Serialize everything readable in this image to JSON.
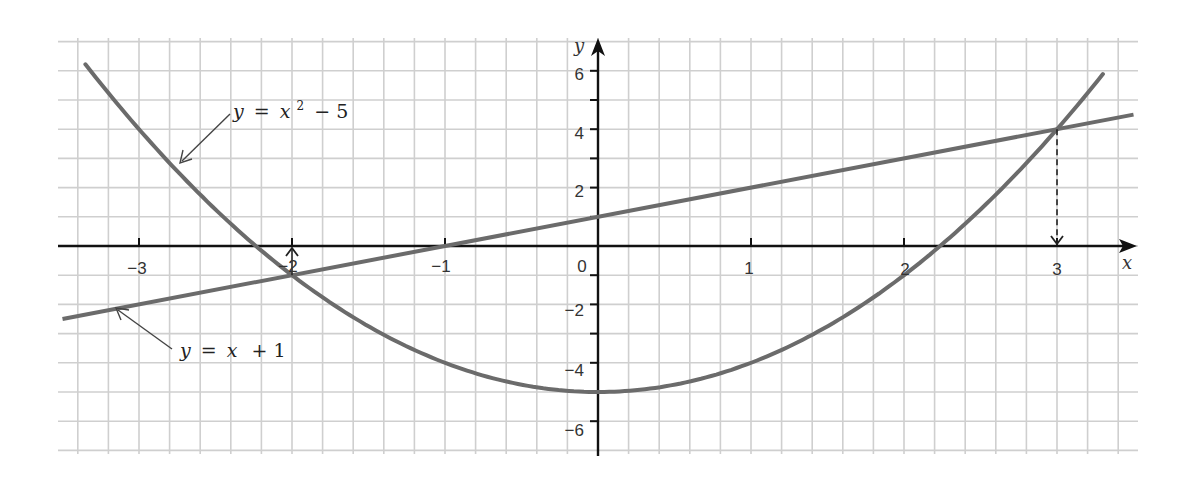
{
  "chart_data": {
    "type": "line",
    "title": "",
    "xlabel": "x",
    "ylabel": "y",
    "xlim": [
      -3.5,
      3.55
    ],
    "ylim": [
      -7,
      7
    ],
    "grid": true,
    "x_ticks": [
      -3,
      -2,
      -1,
      0,
      1,
      2,
      3
    ],
    "x_tick_labels": [
      "−3",
      "−2",
      "−1",
      "0",
      "1",
      "2",
      "3"
    ],
    "y_ticks": [
      6,
      4,
      2,
      -2,
      -4,
      -6
    ],
    "y_tick_labels": [
      "6",
      "4",
      "2",
      "−2",
      "−4",
      "−6"
    ],
    "series": [
      {
        "name": "y = x² − 5",
        "equation": "y = x^2 - 5",
        "x": [
          -3.35,
          -3,
          -2.5,
          -2,
          -1.5,
          -1,
          -0.5,
          0,
          0.5,
          1,
          1.5,
          2,
          2.5,
          3,
          3.3
        ],
        "values": [
          6.2,
          4,
          1.25,
          -1,
          -2.75,
          -4,
          -4.75,
          -5,
          -4.75,
          -4,
          -2.75,
          -1,
          1.25,
          4,
          5.9
        ]
      },
      {
        "name": "y = x + 1",
        "equation": "y = x + 1",
        "x": [
          -3.5,
          3.5
        ],
        "values": [
          -2.5,
          4.5
        ]
      }
    ],
    "annotations": [
      {
        "type": "intersection",
        "x": -2,
        "y": -1,
        "marker": "arrow up to x-axis at -2"
      },
      {
        "type": "intersection",
        "x": 3,
        "y": 4,
        "marker": "dashed arrow down to x-axis at 3"
      }
    ],
    "labels": {
      "parabola": {
        "prefix": "y",
        "eq": "=",
        "var": "x",
        "sup": "2",
        "rest": "− 5"
      },
      "line": {
        "prefix": "y",
        "eq": "=",
        "var": "x",
        "rest": "+ 1"
      }
    },
    "colors": {
      "curve": "#6b6b6b",
      "axis": "#111111",
      "grid": "#cfcfcf"
    }
  }
}
